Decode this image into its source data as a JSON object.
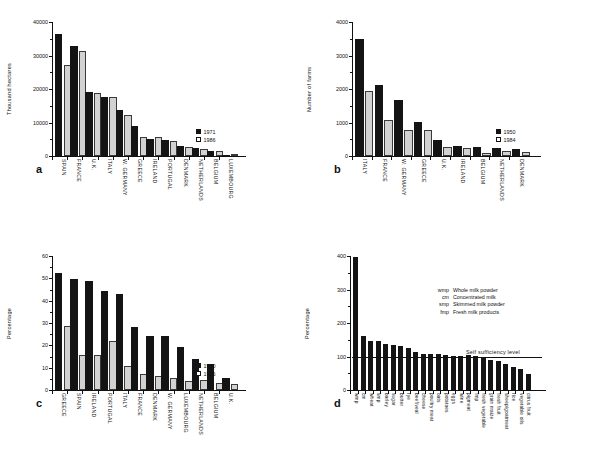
{
  "figure": {
    "background": "#ffffff",
    "series_dark_color": "#141414",
    "series_light_color": "#d2d2d2"
  },
  "panels": {
    "a": {
      "letter": "a"
    },
    "b": {
      "letter": "b"
    },
    "c": {
      "letter": "c"
    },
    "d": {
      "letter": "d"
    }
  },
  "chart_data": [
    {
      "id": "a",
      "type": "bar",
      "title": "",
      "xlabel": "",
      "ylabel": "Thousand hectares",
      "ylim": [
        0,
        40000
      ],
      "yticks": [
        0,
        10000,
        20000,
        30000,
        40000
      ],
      "ytick_labels": [
        "0",
        "10000",
        "20000",
        "30000",
        "40000"
      ],
      "grid": false,
      "legend_position": "right",
      "categories": [
        "SPAIN",
        "FRANCE",
        "U.K.",
        "ITALY",
        "W. GERMANY",
        "GREECE",
        "IRELAND",
        "PORTUGAL",
        "DENMARK",
        "NETHERLANDS",
        "BELGIUM",
        "LUXEMBOURG"
      ],
      "series": [
        {
          "name": "1971",
          "color": "#141414",
          "values": [
            36500,
            32700,
            19100,
            17600,
            13800,
            9000,
            5000,
            4700,
            2950,
            2250,
            1600,
            140
          ]
        },
        {
          "name": "1986",
          "color": "#d2d2d2",
          "values": [
            27100,
            31200,
            18700,
            17600,
            12300,
            5700,
            5700,
            4500,
            2700,
            2000,
            1450,
            130
          ]
        }
      ]
    },
    {
      "id": "b",
      "type": "bar",
      "title": "",
      "xlabel": "",
      "ylabel": "Number of farms",
      "ylim": [
        0,
        4000
      ],
      "yticks": [
        0,
        1000,
        2000,
        3000,
        4000
      ],
      "ytick_labels": [
        "0",
        "1000",
        "2000",
        "3000",
        "4000"
      ],
      "grid": false,
      "legend_position": "right",
      "categories": [
        "ITALY",
        "FRANCE",
        "W. GERMANY",
        "GREECE",
        "U.K.",
        "IRELAND",
        "BELGIUM",
        "NETHERLANDS",
        "DENMARK"
      ],
      "series": [
        {
          "name": "1950",
          "color": "#141414",
          "values": [
            3500,
            2120,
            1680,
            1030,
            490,
            310,
            260,
            250,
            215
          ]
        },
        {
          "name": "1984",
          "color": "#d2d2d2",
          "values": [
            1940,
            1090,
            780,
            790,
            255,
            230,
            95,
            140,
            105
          ]
        }
      ]
    },
    {
      "id": "c",
      "type": "bar",
      "title": "",
      "xlabel": "",
      "ylabel": "Percentage",
      "ylim": [
        0,
        60
      ],
      "yticks": [
        0,
        10,
        20,
        30,
        40,
        50,
        60
      ],
      "ytick_labels": [
        "0",
        "10",
        "20",
        "30",
        "40",
        "50",
        "60"
      ],
      "grid": false,
      "legend_position": "right",
      "categories": [
        "GREECE",
        "SPAIN",
        "IRELAND",
        "PORTUGAL",
        "ITALY",
        "FRANCE",
        "DENMARK",
        "W. GERMANY",
        "LUXEMBOURG",
        "NETHERLANDS",
        "BELGIUM",
        "U.K."
      ],
      "series": [
        {
          "name": "1950",
          "color": "#141414",
          "values": [
            52.5,
            49.7,
            48.6,
            44.2,
            42.8,
            28.4,
            24.4,
            24.0,
            19.1,
            14.1,
            11.8,
            5.6
          ]
        },
        {
          "name": "1986",
          "color": "#d2d2d2",
          "values": [
            28.5,
            15.5,
            15.7,
            21.9,
            10.6,
            7.3,
            6.1,
            5.2,
            3.9,
            4.7,
            3.0,
            2.6
          ]
        }
      ]
    },
    {
      "id": "d",
      "type": "bar",
      "title": "",
      "xlabel": "",
      "ylabel": "Percentage",
      "ylim": [
        0,
        400
      ],
      "yticks": [
        0,
        100,
        200,
        300,
        400
      ],
      "ytick_labels": [
        "0",
        "100",
        "200",
        "300",
        "400"
      ],
      "grid": false,
      "annotation_line": {
        "value": 100,
        "label": "Self sufficiency level"
      },
      "categories": [
        "wmp",
        "cm",
        "wheat",
        "smp",
        "barley",
        "sugar",
        "butter",
        "rye",
        "beef/veal",
        "cheese",
        "poultry meat",
        "oats",
        "potatoes",
        "eggs",
        "wine",
        "pigmeat",
        "fmp",
        "fresh vegetable",
        "grain maize",
        "fresh fruit",
        "sheep/goatmeat",
        "rice",
        "vegetable oils",
        "citrus fruit"
      ],
      "series": [
        {
          "name": "Self sufficiency",
          "color": "#141414",
          "values": [
            397,
            161,
            146,
            145,
            136,
            134,
            131,
            126,
            113,
            109,
            109,
            109,
            105,
            103,
            102,
            104,
            101,
            100,
            91,
            88,
            77,
            70,
            63,
            48
          ]
        }
      ]
    }
  ],
  "legends": {
    "a": [
      {
        "label": "1971",
        "style": "dark"
      },
      {
        "label": "1986",
        "style": "light"
      }
    ],
    "b": [
      {
        "label": "1950",
        "style": "dark"
      },
      {
        "label": "1984",
        "style": "light"
      }
    ],
    "c": [
      {
        "label": "1950",
        "style": "dark"
      },
      {
        "label": "1986",
        "style": "light"
      }
    ]
  },
  "abbreviations": [
    {
      "key": "wmp",
      "text": "Whole milk powder"
    },
    {
      "key": "cm",
      "text": "Concentrated milk"
    },
    {
      "key": "smp",
      "text": "Skimmed milk powder"
    },
    {
      "key": "fmp",
      "text": "Fresh milk products"
    }
  ]
}
